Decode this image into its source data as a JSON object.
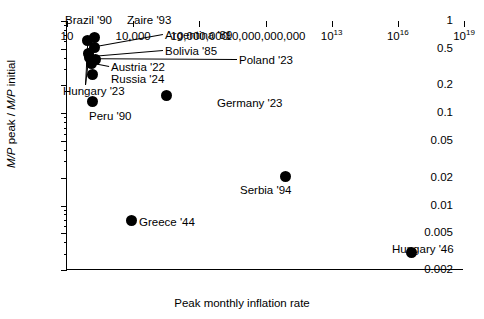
{
  "chart_data": {
    "type": "scatter",
    "title": "",
    "xlabel": "Peak monthly inflation rate",
    "ylabel": "M/P peak / M/P initial",
    "xscale": "log",
    "yscale": "log",
    "xlim": [
      10,
      1e+19
    ],
    "ylim": [
      0.002,
      1
    ],
    "grid": false,
    "legend": "none",
    "xticks": [
      {
        "value": 10,
        "label": "10",
        "exp": null
      },
      {
        "value": 10000,
        "label": "10,000",
        "exp": null
      },
      {
        "value": 10000000,
        "label": "10,000,000",
        "exp": null
      },
      {
        "value": 10000000000,
        "label": "10,000,000,000",
        "exp": null
      },
      {
        "value": 10000000000000.0,
        "label": "10",
        "exp": "13"
      },
      {
        "value": 1e+16,
        "label": "10",
        "exp": "16"
      },
      {
        "value": 1e+19,
        "label": "10",
        "exp": "19"
      }
    ],
    "yticks_major": [
      {
        "value": 1,
        "label": "1"
      },
      {
        "value": 0.5,
        "label": "0.5"
      },
      {
        "value": 0.2,
        "label": "0.2"
      },
      {
        "value": 0.1,
        "label": "0.1"
      },
      {
        "value": 0.05,
        "label": "0.05"
      },
      {
        "value": 0.02,
        "label": "0.02"
      },
      {
        "value": 0.01,
        "label": "0.01"
      },
      {
        "value": 0.005,
        "label": "0.005"
      },
      {
        "value": 0.002,
        "label": "0.002"
      }
    ],
    "yticks_minor": [
      0.9,
      0.8,
      0.7,
      0.6,
      0.4,
      0.3,
      0.09,
      0.08,
      0.07,
      0.06,
      0.04,
      0.03,
      0.009,
      0.008,
      0.007,
      0.006,
      0.004,
      0.003
    ],
    "points": [
      {
        "name": "Brazil '90",
        "x": 84,
        "y": 0.62
      },
      {
        "name": "Zaire '93",
        "x": 170,
        "y": 0.66
      },
      {
        "name": "Argentina '89",
        "x": 178,
        "y": 0.52
      },
      {
        "name": "Bolivia '85",
        "x": 105,
        "y": 0.405
      },
      {
        "name": "Poland '23",
        "x": 190,
        "y": 0.385
      },
      {
        "name": "Austria '22",
        "x": 125,
        "y": 0.345
      },
      {
        "name": "Russia '24",
        "x": 150,
        "y": 0.265
      },
      {
        "name": "Hungary '23",
        "x": 97,
        "y": 0.44
      },
      {
        "name": "Peru '90",
        "x": 150,
        "y": 0.135
      },
      {
        "name": "Germany '23",
        "x": 320000,
        "y": 0.155
      },
      {
        "name": "Serbia '94",
        "x": 80000000000.0,
        "y": 0.0205
      },
      {
        "name": "Greece '44",
        "x": 8500,
        "y": 0.0068
      },
      {
        "name": "Hungary '46",
        "x": 4e+16,
        "y": 0.0031
      }
    ],
    "annotations": [
      {
        "label": "Brazil '90",
        "anchor": "above-left"
      },
      {
        "label": "Zaire '93",
        "anchor": "right"
      },
      {
        "label": "Argentina '89",
        "anchor": "right-leader"
      },
      {
        "label": "Bolivia '85",
        "anchor": "right-leader"
      },
      {
        "label": "Poland '23",
        "anchor": "right-leader"
      },
      {
        "label": "Austria '22",
        "anchor": "right-leader"
      },
      {
        "label": "Russia '24",
        "anchor": "right"
      },
      {
        "label": "Hungary '23",
        "anchor": "below-left-leader"
      },
      {
        "label": "Peru '90",
        "anchor": "below"
      },
      {
        "label": "Germany '23",
        "anchor": "right"
      },
      {
        "label": "Serbia '94",
        "anchor": "below-right"
      },
      {
        "label": "Greece '44",
        "anchor": "right"
      },
      {
        "label": "Hungary '46",
        "anchor": "above"
      }
    ]
  },
  "axis": {
    "x_title": "Peak monthly inflation rate",
    "y_title_part1": "M/P",
    "y_title_part2": " peak / ",
    "y_title_part3": "M/P",
    "y_title_part4": " initial"
  },
  "labels": {
    "brazil": "Brazil '90",
    "zaire": "Zaire '93",
    "argentina": "Argentina '89",
    "bolivia": "Bolivia '85",
    "poland": "Poland '23",
    "austria": "Austria '22",
    "russia": "Russia '24",
    "hungary23": "Hungary '23",
    "peru": "Peru '90",
    "germany": "Germany '23",
    "serbia": "Serbia '94",
    "greece": "Greece '44",
    "hungary46": "Hungary '46"
  }
}
